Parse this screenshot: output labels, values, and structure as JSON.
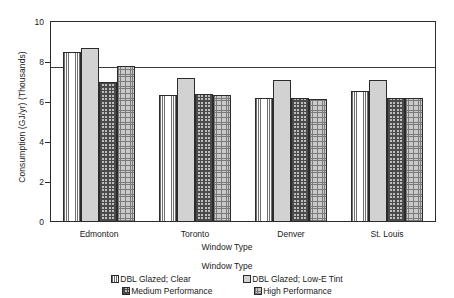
{
  "chart_data": {
    "type": "bar",
    "title": "",
    "xlabel": "Window Type",
    "ylabel": "Consumption (GJ/yr) (Thousands)",
    "categories": [
      "Edmonton",
      "Toronto",
      "Denver",
      "St. Louis"
    ],
    "series": [
      {
        "name": "DBL Glazed; Clear",
        "pattern": "vertical-lines",
        "values": [
          8.5,
          6.35,
          6.2,
          6.55
        ]
      },
      {
        "name": "DBL Glazed; Low-E Tint",
        "pattern": "fine-dots",
        "values": [
          8.7,
          7.2,
          7.1,
          7.1
        ]
      },
      {
        "name": "Medium Performance",
        "pattern": "dense-crosshatch",
        "values": [
          7.0,
          6.4,
          6.2,
          6.2
        ]
      },
      {
        "name": "High Performance",
        "pattern": "coarse-dots",
        "values": [
          7.8,
          6.35,
          6.15,
          6.2
        ]
      }
    ],
    "ylim": [
      0,
      10
    ],
    "yticks": [
      0,
      2,
      4,
      6,
      8,
      10
    ],
    "ytick_labels": [
      "0",
      "2",
      "4",
      "6",
      "8",
      "10"
    ],
    "grid": true,
    "legend_position": "bottom",
    "legend_title": "Window Type"
  }
}
